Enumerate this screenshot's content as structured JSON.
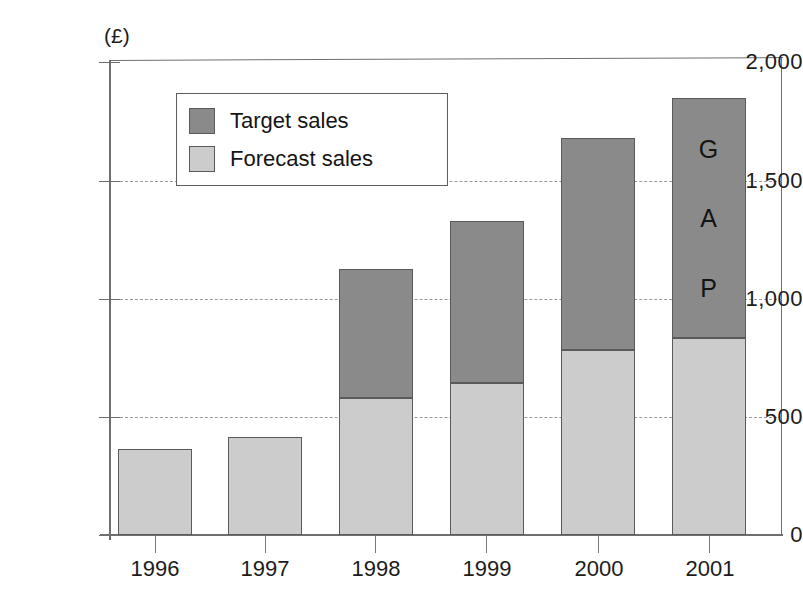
{
  "chart_data": {
    "type": "bar",
    "subtype": "stacked-bar",
    "title": "",
    "xlabel": "",
    "ylabel": "",
    "unit_note": "(£)",
    "categories": [
      "1996",
      "1997",
      "1998",
      "1999",
      "2000",
      "2001"
    ],
    "series": [
      {
        "name": "Forecast sales",
        "color": "#cccccc",
        "values": [
          364,
          415,
          580,
          643,
          782,
          833
        ]
      },
      {
        "name": "Target sales",
        "color": "#8a8a8a",
        "values": [
          0,
          0,
          545,
          685,
          897,
          1015
        ]
      }
    ],
    "totals": [
      364,
      415,
      1125,
      1328,
      1679,
      1848
    ],
    "ylim": [
      0,
      2000
    ],
    "yticks": [
      0,
      500,
      1000,
      1500,
      2000
    ],
    "ytick_labels": [
      "0",
      "500",
      "1,000",
      "1,500",
      "2,000"
    ],
    "grid": "horizontal-dashed",
    "legend_position": "upper-left-inside",
    "annotations": [
      {
        "text": "GAP",
        "letters": [
          "G",
          "A",
          "P"
        ],
        "target_category": "2001",
        "orientation": "vertical-stacked"
      }
    ]
  },
  "legend": {
    "items": [
      {
        "label": "Target sales",
        "color": "#8a8a8a"
      },
      {
        "label": "Forecast sales",
        "color": "#cccccc"
      }
    ]
  },
  "axes": {
    "y": {
      "unit": "(£)",
      "ticks": [
        {
          "value": 2000,
          "label": "2,000"
        },
        {
          "value": 1500,
          "label": "1,500"
        },
        {
          "value": 1000,
          "label": "1,000"
        },
        {
          "value": 500,
          "label": "500"
        },
        {
          "value": 0,
          "label": "0"
        }
      ]
    },
    "x": {
      "ticks": [
        "1996",
        "1997",
        "1998",
        "1999",
        "2000",
        "2001"
      ]
    }
  },
  "annotation_gap": {
    "letter_1": "G",
    "letter_2": "A",
    "letter_3": "P"
  },
  "colors": {
    "target": "#8a8a8a",
    "forecast": "#cccccc",
    "axis": "#6e6e6e",
    "grid": "#9a9a9a",
    "text": "#1c1c1c",
    "background": "#ffffff"
  }
}
